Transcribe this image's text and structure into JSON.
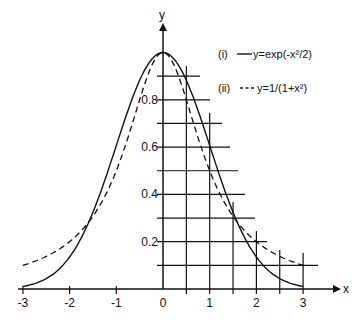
{
  "chart_data": {
    "type": "line",
    "title": "",
    "xlabel": "x",
    "ylabel": "y",
    "xlim": [
      -3,
      3
    ],
    "ylim": [
      0,
      1
    ],
    "x_ticks": [
      "-3",
      "-2",
      "-1",
      "0",
      "1",
      "2",
      "3"
    ],
    "y_ticks": [
      "0.2",
      "0.4",
      "0.6",
      "0.8"
    ],
    "grid": "partial grid in first quadrant (x step 0.5, y step 0.1)",
    "legend_position": "upper right",
    "x": [
      -3,
      -2.5,
      -2,
      -1.5,
      -1,
      -0.5,
      0,
      0.5,
      1,
      1.5,
      2,
      2.5,
      3
    ],
    "series": [
      {
        "name": "(i)",
        "label": "y=exp(-x²/2)",
        "style": "solid",
        "values": [
          0.011,
          0.044,
          0.135,
          0.325,
          0.607,
          0.882,
          1.0,
          0.882,
          0.607,
          0.325,
          0.135,
          0.044,
          0.011
        ]
      },
      {
        "name": "(ii)",
        "label": "y=1/(1+x²)",
        "style": "dashed",
        "values": [
          0.1,
          0.138,
          0.2,
          0.308,
          0.5,
          0.8,
          1.0,
          0.8,
          0.5,
          0.308,
          0.2,
          0.138,
          0.1
        ]
      }
    ]
  },
  "legend": {
    "items": [
      {
        "id": "(i)",
        "sample": "——",
        "text": "y=exp(-x²/2)"
      },
      {
        "id": "(ii)",
        "sample": "---",
        "text": "y=1/(1+x²)"
      }
    ]
  },
  "axes": {
    "x_label": "x",
    "y_label": "y"
  }
}
